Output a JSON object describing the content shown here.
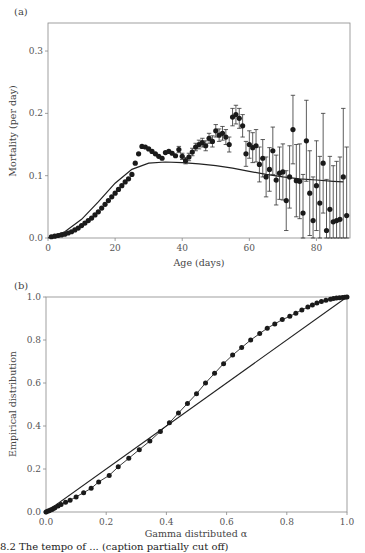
{
  "chart_data": [
    {
      "panel": "(a)",
      "type": "scatter",
      "title": "",
      "xlabel": "Age (days)",
      "ylabel": "Mortality (per day)",
      "xlim": [
        0,
        90
      ],
      "ylim": [
        0,
        0.345
      ],
      "xticks": [
        0,
        20,
        40,
        60,
        80
      ],
      "xtick_labels": [
        "0",
        "20",
        "40",
        "60",
        "80"
      ],
      "yticks": [
        0.0,
        0.1,
        0.2,
        0.3
      ],
      "ytick_labels": [
        "0.0",
        "0.1",
        "0.2",
        "0.3"
      ],
      "grid": false,
      "legend": null,
      "series": [
        {
          "name": "Observed mortality (points with error bars)",
          "style": "filled-circle-with-errorbars",
          "points": [
            [
              1,
              0.002,
              0.001
            ],
            [
              2,
              0.003,
              0.001
            ],
            [
              3,
              0.004,
              0.001
            ],
            [
              4,
              0.005,
              0.001
            ],
            [
              5,
              0.006,
              0.001
            ],
            [
              6,
              0.008,
              0.001
            ],
            [
              7,
              0.01,
              0.001
            ],
            [
              8,
              0.013,
              0.001
            ],
            [
              9,
              0.016,
              0.001
            ],
            [
              10,
              0.02,
              0.001
            ],
            [
              11,
              0.024,
              0.001
            ],
            [
              12,
              0.028,
              0.002
            ],
            [
              13,
              0.032,
              0.002
            ],
            [
              14,
              0.037,
              0.002
            ],
            [
              15,
              0.042,
              0.002
            ],
            [
              16,
              0.048,
              0.002
            ],
            [
              17,
              0.054,
              0.002
            ],
            [
              18,
              0.06,
              0.002
            ],
            [
              19,
              0.066,
              0.002
            ],
            [
              20,
              0.072,
              0.002
            ],
            [
              21,
              0.078,
              0.002
            ],
            [
              22,
              0.084,
              0.002
            ],
            [
              23,
              0.09,
              0.002
            ],
            [
              24,
              0.095,
              0.003
            ],
            [
              25,
              0.102,
              0.003
            ],
            [
              26,
              0.12,
              0.003
            ],
            [
              27,
              0.135,
              0.003
            ],
            [
              28,
              0.147,
              0.003
            ],
            [
              29,
              0.146,
              0.003
            ],
            [
              30,
              0.143,
              0.003
            ],
            [
              31,
              0.139,
              0.003
            ],
            [
              32,
              0.135,
              0.003
            ],
            [
              33,
              0.131,
              0.003
            ],
            [
              34,
              0.128,
              0.004
            ],
            [
              35,
              0.137,
              0.004
            ],
            [
              36,
              0.139,
              0.004
            ],
            [
              37,
              0.136,
              0.004
            ],
            [
              38,
              0.132,
              0.004
            ],
            [
              39,
              0.142,
              0.005
            ],
            [
              40,
              0.131,
              0.005
            ],
            [
              41,
              0.124,
              0.005
            ],
            [
              42,
              0.13,
              0.006
            ],
            [
              43,
              0.138,
              0.006
            ],
            [
              44,
              0.146,
              0.006
            ],
            [
              45,
              0.15,
              0.007
            ],
            [
              46,
              0.153,
              0.007
            ],
            [
              47,
              0.148,
              0.008
            ],
            [
              48,
              0.16,
              0.008
            ],
            [
              49,
              0.155,
              0.009
            ],
            [
              50,
              0.172,
              0.01
            ],
            [
              51,
              0.165,
              0.01
            ],
            [
              52,
              0.168,
              0.011
            ],
            [
              53,
              0.162,
              0.012
            ],
            [
              54,
              0.15,
              0.012
            ],
            [
              55,
              0.194,
              0.014
            ],
            [
              56,
              0.198,
              0.015
            ],
            [
              57,
              0.192,
              0.016
            ],
            [
              58,
              0.18,
              0.018
            ],
            [
              59,
              0.135,
              0.02
            ],
            [
              60,
              0.15,
              0.022
            ],
            [
              61,
              0.145,
              0.024
            ],
            [
              62,
              0.148,
              0.026
            ],
            [
              63,
              0.118,
              0.028
            ],
            [
              64,
              0.128,
              0.03
            ],
            [
              65,
              0.098,
              0.032
            ],
            [
              66,
              0.11,
              0.035
            ],
            [
              67,
              0.14,
              0.038
            ],
            [
              68,
              0.093,
              0.04
            ],
            [
              69,
              0.104,
              0.042
            ],
            [
              70,
              0.106,
              0.045
            ],
            [
              71,
              0.06,
              0.048
            ],
            [
              72,
              0.098,
              0.05
            ],
            [
              73,
              0.174,
              0.055
            ],
            [
              74,
              0.092,
              0.058
            ],
            [
              75,
              0.091,
              0.06
            ],
            [
              76,
              0.04,
              0.062
            ],
            [
              77,
              0.156,
              0.065
            ],
            [
              78,
              0.072,
              0.068
            ],
            [
              79,
              0.028,
              0.07
            ],
            [
              80,
              0.084,
              0.072
            ],
            [
              81,
              0.056,
              0.075
            ],
            [
              82,
              0.12,
              0.08
            ],
            [
              83,
              0.012,
              0.082
            ],
            [
              84,
              0.046,
              0.085
            ],
            [
              85,
              0.026,
              0.09
            ],
            [
              86,
              0.028,
              0.095
            ],
            [
              87,
              0.03,
              0.1
            ],
            [
              88,
              0.098,
              0.11
            ],
            [
              89,
              0.036,
              0.11
            ]
          ],
          "points_format": "[age, mortality, error]"
        },
        {
          "name": "Fitted model (solid line)",
          "style": "line",
          "x": [
            0,
            5,
            10,
            15,
            20,
            25,
            30,
            35,
            40,
            45,
            50,
            55,
            60,
            65,
            70,
            75,
            80,
            85,
            88
          ],
          "y": [
            0.0,
            0.01,
            0.03,
            0.058,
            0.088,
            0.11,
            0.12,
            0.122,
            0.121,
            0.119,
            0.116,
            0.112,
            0.107,
            0.102,
            0.098,
            0.095,
            0.093,
            0.091,
            0.09
          ]
        }
      ]
    },
    {
      "panel": "(b)",
      "type": "scatter",
      "title": "",
      "xlabel": "Gamma distributed α",
      "ylabel": "Empirical distribution",
      "xlim": [
        0,
        1.0
      ],
      "ylim": [
        0,
        1.0
      ],
      "xticks": [
        0.0,
        0.2,
        0.4,
        0.6,
        0.8,
        1.0
      ],
      "xtick_labels": [
        "0.0",
        "0.2",
        "0.4",
        "0.6",
        "0.8",
        "1.0"
      ],
      "yticks": [
        0.0,
        0.2,
        0.4,
        0.6,
        0.8,
        1.0
      ],
      "ytick_labels": [
        "0.0",
        "0.2",
        "0.4",
        "0.6",
        "0.8",
        "1.0"
      ],
      "grid": false,
      "legend": null,
      "series": [
        {
          "name": "Empirical vs gamma quantiles",
          "style": "filled-circle-connected",
          "x": [
            0.0,
            0.005,
            0.01,
            0.015,
            0.02,
            0.025,
            0.03,
            0.04,
            0.05,
            0.065,
            0.08,
            0.1,
            0.125,
            0.15,
            0.175,
            0.21,
            0.24,
            0.275,
            0.31,
            0.345,
            0.38,
            0.41,
            0.44,
            0.47,
            0.5,
            0.53,
            0.56,
            0.59,
            0.62,
            0.65,
            0.68,
            0.71,
            0.735,
            0.76,
            0.785,
            0.81,
            0.83,
            0.85,
            0.87,
            0.885,
            0.9,
            0.915,
            0.93,
            0.945,
            0.955,
            0.965,
            0.975,
            0.985,
            0.993,
            1.0
          ],
          "y": [
            0.0,
            0.003,
            0.006,
            0.009,
            0.012,
            0.016,
            0.02,
            0.028,
            0.035,
            0.045,
            0.055,
            0.07,
            0.09,
            0.11,
            0.14,
            0.17,
            0.21,
            0.25,
            0.29,
            0.33,
            0.375,
            0.415,
            0.46,
            0.505,
            0.55,
            0.6,
            0.645,
            0.69,
            0.73,
            0.765,
            0.8,
            0.83,
            0.855,
            0.875,
            0.895,
            0.91,
            0.925,
            0.94,
            0.953,
            0.963,
            0.972,
            0.979,
            0.985,
            0.99,
            0.993,
            0.995,
            0.997,
            0.998,
            0.999,
            1.0
          ]
        },
        {
          "name": "1:1 reference line",
          "style": "line",
          "x": [
            0.0,
            1.0
          ],
          "y": [
            0.0,
            1.0
          ]
        }
      ]
    }
  ],
  "figure": {
    "panel_a_label": "(a)",
    "panel_b_label": "(b)",
    "caption_fragment": "8.2  The tempo of ... (caption partially cut off)"
  }
}
